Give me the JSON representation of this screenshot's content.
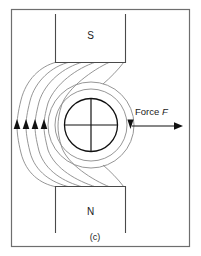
{
  "figure": {
    "caption": "(c)",
    "border_color": "#6e6e6e",
    "background_color": "#ffffff",
    "poles": [
      {
        "id": "south",
        "label": "S",
        "position": "top"
      },
      {
        "id": "north",
        "label": "N",
        "position": "bottom"
      }
    ],
    "conductor": {
      "name": "current-carrying-conductor",
      "marking": "crosshair",
      "line_color": "#1a1a1a"
    },
    "force": {
      "label_prefix": "Force",
      "label_symbol": "F",
      "direction": "right"
    },
    "field_lines": {
      "color": "#8a8a8a",
      "left_arrow_count": 4,
      "left_arrow_direction": "up",
      "right_arrow_direction": "down"
    }
  }
}
